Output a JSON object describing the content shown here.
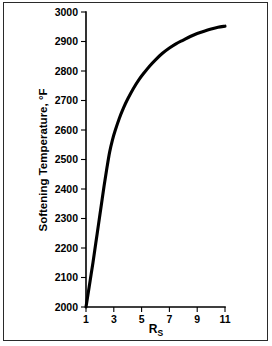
{
  "figure": {
    "background_color": "#ffffff",
    "border_color": "#2a2a2a",
    "curve_color": "#000000",
    "axis_color": "#000000"
  },
  "chart_data": {
    "type": "line",
    "title": "",
    "subtitle": "",
    "xlabel": "R",
    "xlabel_subscript": "S",
    "xlabel_full": "Rs",
    "ylabel": "Softening Temperature, °F",
    "xlim": [
      1,
      11
    ],
    "ylim": [
      2000,
      3000
    ],
    "grid": false,
    "legend": false,
    "legend_position": "none",
    "x_ticks": [
      1,
      3,
      5,
      7,
      9,
      11
    ],
    "x_tick_labels": [
      "1",
      "3",
      "5",
      "7",
      "9",
      "11"
    ],
    "x_minor_ticks": [
      2,
      4,
      6,
      8,
      10
    ],
    "y_ticks": [
      2000,
      2100,
      2200,
      2300,
      2400,
      2500,
      2600,
      2700,
      2800,
      2900,
      3000
    ],
    "y_tick_labels": [
      "2000",
      "2100",
      "2200",
      "2300",
      "2400",
      "2500",
      "2600",
      "2700",
      "2800",
      "2900",
      "3000"
    ],
    "series": [
      {
        "name": "Softening Temperature",
        "color": "#000000",
        "line_width": 3.1,
        "x": [
          1.0,
          1.1,
          1.3,
          1.5,
          1.7,
          1.9,
          2.1,
          2.3,
          2.5,
          2.7,
          2.9,
          3.1,
          3.4,
          3.7,
          4.0,
          4.4,
          4.8,
          5.2,
          5.6,
          6.0,
          6.5,
          7.0,
          7.5,
          8.0,
          8.5,
          9.0,
          9.5,
          10.0,
          10.5,
          11.0
        ],
        "y": [
          2000,
          2030,
          2090,
          2150,
          2215,
          2280,
          2345,
          2410,
          2470,
          2525,
          2566,
          2598,
          2640,
          2675,
          2705,
          2740,
          2770,
          2795,
          2818,
          2838,
          2860,
          2878,
          2893,
          2905,
          2917,
          2927,
          2935,
          2942,
          2948,
          2952
        ]
      }
    ]
  }
}
